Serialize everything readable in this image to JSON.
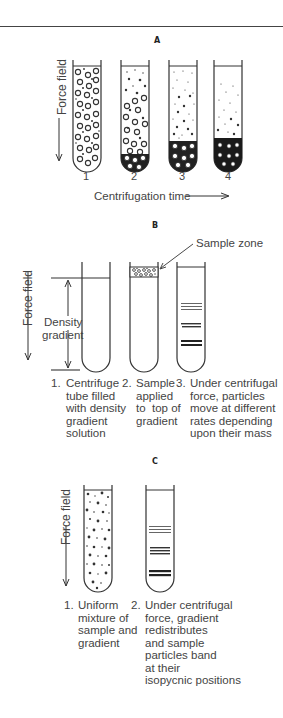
{
  "figure": {
    "panel_a": {
      "label": "A",
      "axis_label": "Force field",
      "x_label": "Centrifugation time",
      "tube_numbers": [
        "1",
        "2",
        "3",
        "4"
      ]
    },
    "panel_b": {
      "label": "B",
      "axis_label": "Force field",
      "sample_zone_label": "Sample zone",
      "density_label_line1": "Density",
      "density_label_line2": "gradient",
      "steps": [
        {
          "num": "1.",
          "text": "Centrifuge\ntube filled\nwith density\ngradient\nsolution"
        },
        {
          "num": "2.",
          "text": "Sample\napplied\nto  top of\ngradient"
        },
        {
          "num": "3.",
          "text": "Under centrifugal\nforce, particles\nmove at different\nrates depending\nupon their mass"
        }
      ]
    },
    "panel_c": {
      "label": "C",
      "axis_label": "Force field",
      "steps": [
        {
          "num": "1.",
          "text": "Uniform\nmixture of\nsample and\ngradient"
        },
        {
          "num": "2.",
          "text": "Under centrifugal\nforce, gradient\nredistributes\nand sample\nparticles band\nat their\nisopycnic positions"
        }
      ]
    }
  }
}
